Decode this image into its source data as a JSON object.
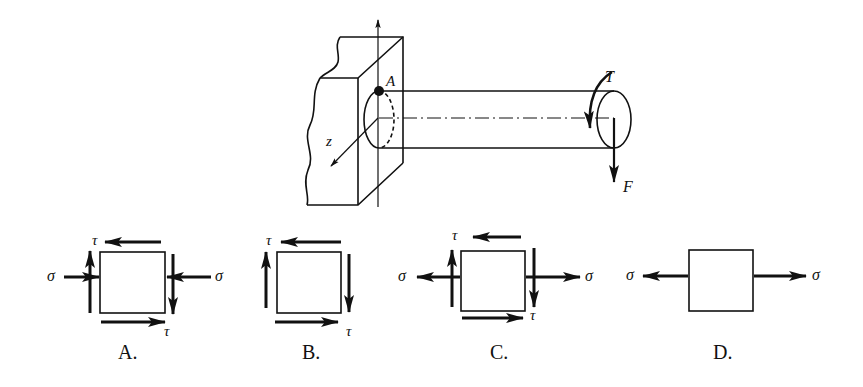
{
  "main_figure": {
    "point_label": "A",
    "axis_label_z": "z",
    "torque_label": "T",
    "force_label": "F"
  },
  "options": [
    {
      "label": "A.",
      "shear_symbol": "τ",
      "normal_symbol": "σ",
      "normal_stress": "compressive",
      "has_shear": true
    },
    {
      "label": "B.",
      "shear_symbol": "τ",
      "normal_stress": "none",
      "has_shear": true
    },
    {
      "label": "C.",
      "shear_symbol": "τ",
      "normal_symbol": "σ",
      "normal_stress": "tensile",
      "has_shear": true
    },
    {
      "label": "D.",
      "normal_symbol": "σ",
      "normal_stress": "tensile",
      "has_shear": false
    }
  ],
  "colors": {
    "ink": "#111111",
    "background": "#ffffff"
  }
}
